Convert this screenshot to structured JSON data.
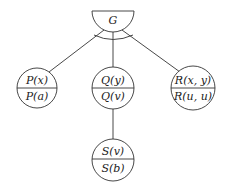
{
  "diagram": {
    "type": "and-or goal tree",
    "root": {
      "label": "G",
      "shape": "half-circle",
      "and_link": true
    },
    "children": [
      {
        "id": "p",
        "top": "P(x)",
        "bottom": "P(a)"
      },
      {
        "id": "q",
        "top": "Q(y)",
        "bottom": "Q(v)"
      },
      {
        "id": "r",
        "top": "R(x, y)",
        "bottom": "R(u, u)"
      }
    ],
    "grandchildren": [
      {
        "id": "s",
        "parent": "q",
        "top": "S(v)",
        "bottom": "S(b)"
      }
    ],
    "colors": {
      "line": "#333333",
      "text": "#222222",
      "background": "#ffffff"
    }
  }
}
